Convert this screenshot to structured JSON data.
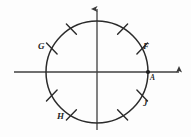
{
  "figure": {
    "background_color": "#fdfdfd",
    "stroke_color": "#2b2b2b",
    "axis_color": "#3a3a3a",
    "width": 191,
    "height": 137
  },
  "diagram_data": {
    "type": "geometry-diagram",
    "description": "A circle centered at the origin of a two-axis coordinate system, with eight short tick marks crossing the circle and five labeled points.",
    "center": {
      "x": 97,
      "y": 72
    },
    "radius": 51,
    "axes": {
      "x_axis": {
        "from_x": 14,
        "to_x": 182,
        "y": 72,
        "arrow": "right"
      },
      "y_axis": {
        "x": 97,
        "from_y": 130,
        "to_y": 6,
        "arrow": "up"
      }
    },
    "marked_point": {
      "label": "A",
      "angle_deg": 0,
      "x": 148,
      "y": 72,
      "dot": true
    },
    "tick_marks_deg": [
      30,
      60,
      120,
      150,
      210,
      240,
      300,
      330
    ],
    "labels": [
      {
        "name": "G",
        "text": "G",
        "angle_deg": 150
      },
      {
        "name": "F",
        "text": "F",
        "angle_deg": 30
      },
      {
        "name": "A",
        "text": "A",
        "angle_deg": 0
      },
      {
        "name": "J",
        "text": "J",
        "angle_deg": 330
      },
      {
        "name": "H",
        "text": "H",
        "angle_deg": 240
      }
    ]
  }
}
